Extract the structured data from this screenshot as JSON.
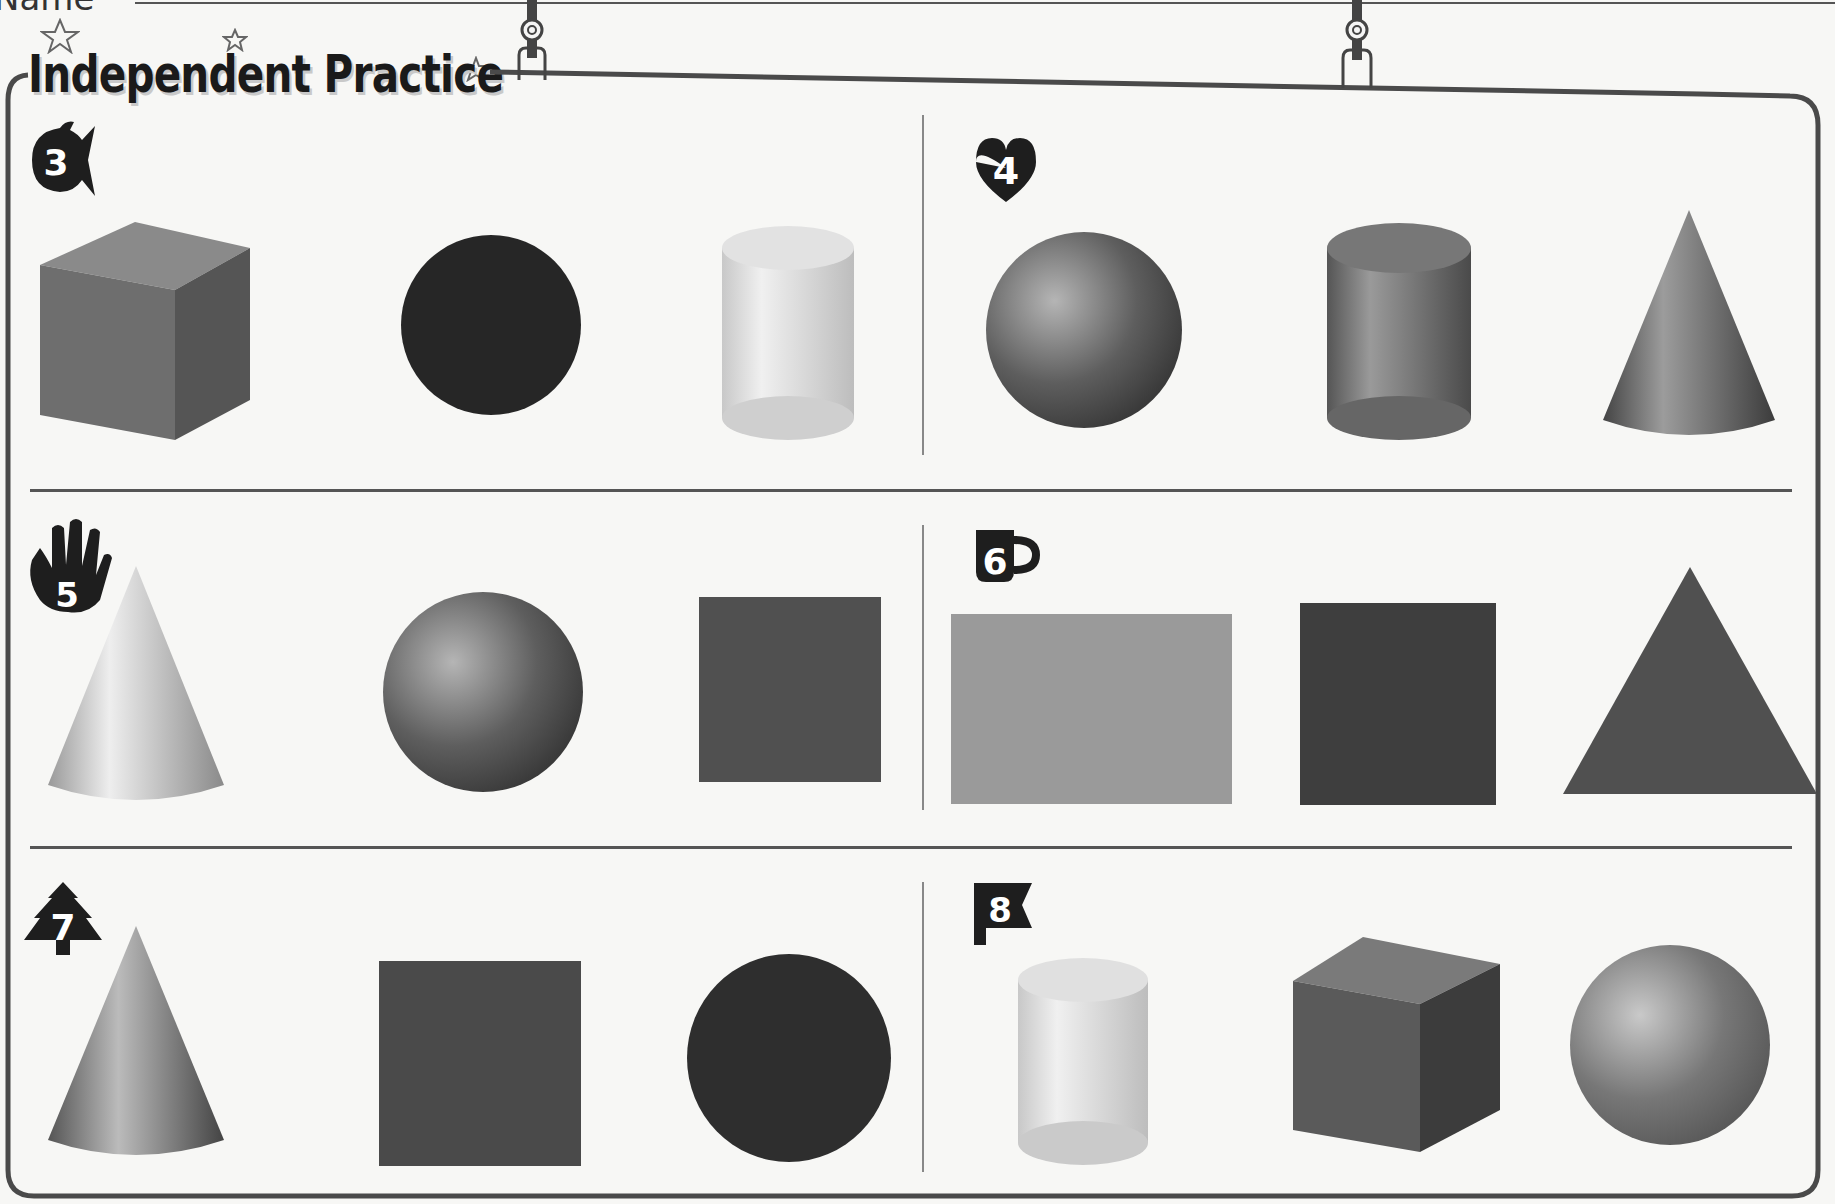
{
  "header": {
    "name_label": "Name",
    "title": "Independent Practice"
  },
  "problems": [
    {
      "number": "3",
      "icon": "fish-icon",
      "shapes": [
        "cube",
        "circle",
        "cylinder"
      ],
      "colors": [
        "#6e6e6e",
        "#2a2a2a",
        "#d8d8d8"
      ]
    },
    {
      "number": "4",
      "icon": "heart-icon",
      "shapes": [
        "sphere",
        "cylinder",
        "cone"
      ],
      "colors": [
        "#5a5a5a",
        "#666666",
        "#555555"
      ]
    },
    {
      "number": "5",
      "icon": "hand-icon",
      "shapes": [
        "cone",
        "sphere",
        "square"
      ],
      "colors": [
        "#b8b8b8",
        "#5c5c5c",
        "#505050"
      ]
    },
    {
      "number": "6",
      "icon": "mug-icon",
      "shapes": [
        "rectangle",
        "square",
        "triangle"
      ],
      "colors": [
        "#9a9a9a",
        "#3e3e3e",
        "#505050"
      ]
    },
    {
      "number": "7",
      "icon": "tree-icon",
      "shapes": [
        "cone",
        "square",
        "circle"
      ],
      "colors": [
        "#777777",
        "#4a4a4a",
        "#2e2e2e"
      ]
    },
    {
      "number": "8",
      "icon": "flag-icon",
      "shapes": [
        "cylinder",
        "cube",
        "sphere"
      ],
      "colors": [
        "#d4d4d4",
        "#555555",
        "#6a6a6a"
      ]
    }
  ]
}
